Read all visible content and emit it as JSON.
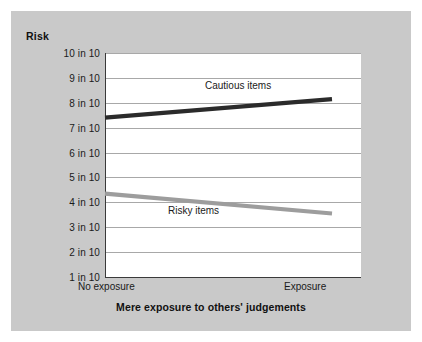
{
  "chart_data": {
    "type": "line",
    "title": "",
    "ylabel": "Risk",
    "xlabel": "Mere exposure to others' judgements",
    "categories": [
      "No exposure",
      "Exposure"
    ],
    "ytick_labels": [
      "10 in 10",
      "9 in 10",
      "8 in 10",
      "7 in 10",
      "6 in 10",
      "5 in 10",
      "4 in 10",
      "3 in 10",
      "2 in 10",
      "1 in 10"
    ],
    "ytick_values": [
      10,
      9,
      8,
      7,
      6,
      5,
      4,
      3,
      2,
      1
    ],
    "ylim": [
      1,
      10
    ],
    "grid": true,
    "legend_position": "inline-annotation",
    "series": [
      {
        "name": "Cautious items",
        "values": [
          7.4,
          8.15
        ],
        "color": "#2b2b2b"
      },
      {
        "name": "Risky items",
        "values": [
          4.35,
          3.55
        ],
        "color": "#9d9d9d"
      }
    ],
    "annotations": [
      {
        "text": "Cautious items",
        "series": "Cautious items"
      },
      {
        "text": "Risky items",
        "series": "Risky items"
      }
    ]
  },
  "figure": {
    "panel_background": "#c9c9c9",
    "plot_background": "#ffffff",
    "axis_color": "#3a3a3a",
    "gridline_color": "#a8a8a8"
  }
}
